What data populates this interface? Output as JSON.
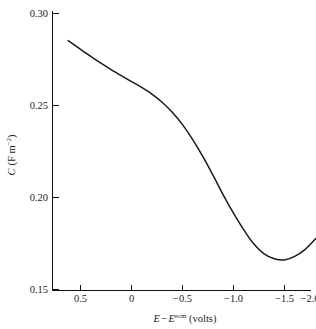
{
  "chart_data": {
    "type": "line",
    "title": "",
    "xlabel": "E − Eᵉᶜᵐ (volts)",
    "ylabel": "C (F m⁻²)",
    "xlabel_parts": {
      "var1": "E",
      "minus": "−",
      "var2": "E",
      "superscript": "ecm",
      "units": "(volts)"
    },
    "ylabel_parts": {
      "var": "C",
      "units": "(F m",
      "exponent": "−2",
      "close": ")"
    },
    "xlim": [
      0.75,
      -2.1
    ],
    "ylim": [
      0.15,
      0.3
    ],
    "xticks": [
      0.5,
      0,
      -0.5,
      -1.0,
      -1.5,
      -2.0
    ],
    "xticklabels": [
      "0.5",
      "0",
      "−0.5",
      "−1.0",
      "−1.5",
      "−2.0"
    ],
    "yticks": [
      0.15,
      0.2,
      0.25,
      0.3
    ],
    "yticklabels": [
      "0.15",
      "0.20",
      "0.25",
      "0.30"
    ],
    "grid": false,
    "legend": null,
    "x_axis_reversed": true,
    "series": [
      {
        "name": "differential capacitance",
        "color": "#1a1a1a",
        "x": [
          0.62,
          0.5,
          0.4,
          0.3,
          0.2,
          0.1,
          0.0,
          -0.1,
          -0.2,
          -0.3,
          -0.4,
          -0.5,
          -0.6,
          -0.7,
          -0.8,
          -0.9,
          -1.0,
          -1.1,
          -1.2,
          -1.3,
          -1.4,
          -1.5,
          -1.6,
          -1.7,
          -1.8,
          -1.93
        ],
        "y": [
          0.2853,
          0.2805,
          0.2767,
          0.273,
          0.2695,
          0.2662,
          0.263,
          0.2598,
          0.2562,
          0.2518,
          0.2463,
          0.2396,
          0.2315,
          0.2222,
          0.212,
          0.2013,
          0.1915,
          0.1825,
          0.1747,
          0.1694,
          0.1667,
          0.1661,
          0.168,
          0.1717,
          0.1773,
          0.1852
        ]
      }
    ],
    "annotations": []
  },
  "figure": {
    "background_color": "#ffffff",
    "axes_color": "#111111"
  }
}
